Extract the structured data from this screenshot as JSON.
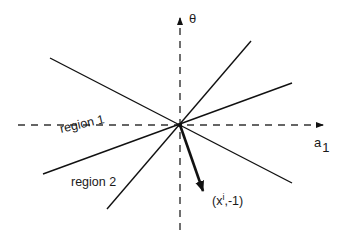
{
  "diagram": {
    "axes": {
      "vertical_label": "θ",
      "horizontal_label": "a",
      "horizontal_label_subscript": "1"
    },
    "regions": [
      {
        "label": "region 1"
      },
      {
        "label": "region 2"
      }
    ],
    "vector": {
      "label_prefix": "(x",
      "label_superscript": "i",
      "label_suffix": ",-1)"
    },
    "colors": {
      "line": "#111111",
      "background": "#ffffff"
    }
  }
}
